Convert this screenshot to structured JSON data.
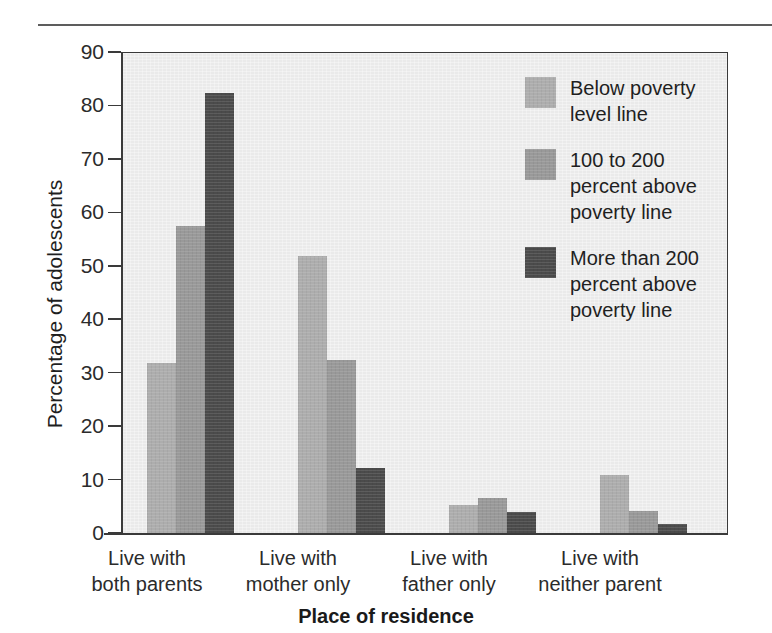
{
  "chart_data": {
    "type": "bar",
    "title": "",
    "subtitle": "",
    "xlabel": "Place of residence",
    "ylabel": "Percentage of adolescents",
    "ylim": [
      0,
      90
    ],
    "yticks": [
      0,
      10,
      20,
      30,
      40,
      50,
      60,
      70,
      80,
      90
    ],
    "ytick_labels": [
      "0",
      "10",
      "20",
      "30",
      "40",
      "50",
      "60",
      "70",
      "80",
      "90"
    ],
    "grid": false,
    "legend_position": "inside upper-right",
    "categories": [
      "Live with both parents",
      "Live with mother only",
      "Live with father only",
      "Live with neither parent"
    ],
    "category_lines": [
      [
        "Live with",
        "both parents"
      ],
      [
        "Live with",
        "mother only"
      ],
      [
        "Live with",
        "father only"
      ],
      [
        "Live with",
        "neither parent"
      ]
    ],
    "series": [
      {
        "name": "Below poverty level line",
        "name_lines": [
          "Below poverty",
          "level line"
        ],
        "color": "#adadad",
        "values": [
          32.0,
          52.0,
          5.5,
          11.0
        ]
      },
      {
        "name": "100 to 200 percent above poverty line",
        "name_lines": [
          "100 to 200",
          "percent above",
          "poverty line"
        ],
        "color": "#999999",
        "values": [
          57.7,
          32.5,
          6.8,
          4.3
        ]
      },
      {
        "name": "More than 200 percent above poverty line",
        "name_lines": [
          "More than 200",
          "percent above",
          "poverty line"
        ],
        "color": "#4b4b4b",
        "values": [
          82.5,
          12.3,
          4.2,
          1.8
        ]
      }
    ]
  },
  "axis": {
    "y_title": "Percentage of adolescents",
    "x_title": "Place of residence",
    "y_ticks": [
      "90",
      "80",
      "70",
      "60",
      "50",
      "40",
      "30",
      "20",
      "10",
      "0"
    ]
  },
  "legend": {
    "items": [
      {
        "label": "Below poverty\nlevel line",
        "color": "#adadad"
      },
      {
        "label": "100 to 200\npercent above\npoverty line",
        "color": "#999999"
      },
      {
        "label": "More than 200\npercent above\npoverty line",
        "color": "#4b4b4b"
      }
    ]
  },
  "categories": {
    "c0_l1": "Live with",
    "c0_l2": "both parents",
    "c1_l1": "Live with",
    "c1_l2": "mother only",
    "c2_l1": "Live with",
    "c2_l2": "father only",
    "c3_l1": "Live with",
    "c3_l2": "neither parent"
  },
  "colors": {
    "series_1": "#adadad",
    "series_2": "#999999",
    "series_3": "#4b4b4b",
    "plot_background": "#eaeaea",
    "axis": "#3a3a3a",
    "text": "#2b2b2b"
  }
}
